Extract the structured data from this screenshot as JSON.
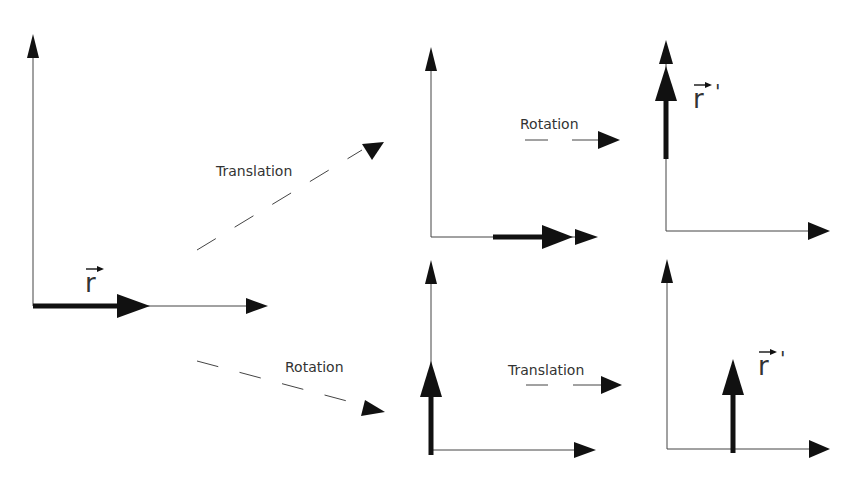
{
  "diagram": {
    "colors": {
      "vector": "#111111",
      "axis": "#444444",
      "text": "#333333",
      "background": "#ffffff"
    },
    "panels": [
      {
        "id": "original",
        "vector_label": "r",
        "vector_direction": "along x-axis, at origin"
      },
      {
        "id": "translated",
        "vector_label": "",
        "vector_direction": "along x-axis, shifted right"
      },
      {
        "id": "translated-then-rotated",
        "vector_label": "r'",
        "vector_direction": "along y-axis, shifted up"
      },
      {
        "id": "rotated",
        "vector_label": "",
        "vector_direction": "along y-axis, at origin"
      },
      {
        "id": "rotated-then-translated",
        "vector_label": "r'",
        "vector_direction": "vertical, shifted right"
      }
    ],
    "transitions": [
      {
        "id": "t1",
        "label": "Translation",
        "from": "original",
        "to": "translated"
      },
      {
        "id": "t2",
        "label": "Rotation",
        "from": "translated",
        "to": "translated-then-rotated"
      },
      {
        "id": "t3",
        "label": "Rotation",
        "from": "original",
        "to": "rotated"
      },
      {
        "id": "t4",
        "label": "Translation",
        "from": "rotated",
        "to": "rotated-then-translated"
      }
    ],
    "vector_symbols": {
      "original": "r",
      "result_top": "r",
      "result_top_prime": "'",
      "result_bottom": "r",
      "result_bottom_prime": "'"
    }
  }
}
